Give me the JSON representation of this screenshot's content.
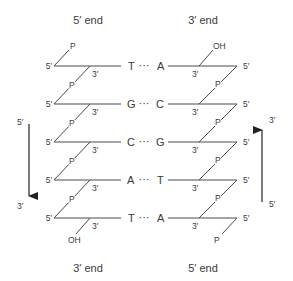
{
  "diagram": {
    "top_left_end": "5′ end",
    "top_right_end": "3′ end",
    "bottom_left_end": "3′ end",
    "bottom_right_end": "5′ end",
    "left_strand": {
      "top_terminal": "P",
      "bottom_terminal": "OH",
      "bases": [
        "T",
        "G",
        "C",
        "A",
        "T"
      ],
      "five_prime_label": "5′",
      "three_prime_label": "3′",
      "linker_label": "P"
    },
    "right_strand": {
      "top_terminal": "OH",
      "bottom_terminal": "P",
      "bases": [
        "A",
        "C",
        "G",
        "T",
        "A"
      ],
      "five_prime_label": "5′",
      "three_prime_label": "3′",
      "linker_label": "P"
    },
    "pair_connector": "···",
    "left_arrow": {
      "direction": "down",
      "start_label": "5′",
      "end_label": "3′"
    },
    "right_arrow": {
      "direction": "up",
      "start_label": "5′",
      "end_label": "3′"
    }
  }
}
